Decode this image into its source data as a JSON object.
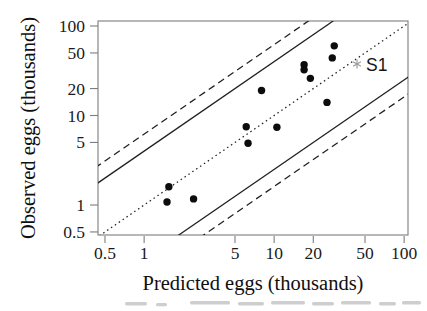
{
  "chart_data": {
    "type": "scatter",
    "title": "",
    "xlabel": "Predicted eggs (thousands)",
    "ylabel": "Observed eggs (thousands)",
    "xscale": "log",
    "yscale": "log",
    "xlim": [
      0.44,
      108
    ],
    "ylim": [
      0.44,
      114
    ],
    "xticks": [
      0.5,
      1,
      5,
      10,
      20,
      50,
      100
    ],
    "xtick_labels": [
      "0.5",
      "1",
      "5",
      "10",
      "20",
      "50",
      "100"
    ],
    "yticks": [
      100,
      50,
      20,
      10,
      5,
      1,
      0.5
    ],
    "ytick_labels": [
      "100",
      "50",
      "20",
      "10",
      "5",
      "1",
      "0.5"
    ],
    "grid": false,
    "legend": "none",
    "points": [
      [
        29,
        60
      ],
      [
        28,
        44
      ],
      [
        17,
        37
      ],
      [
        17,
        32.5
      ],
      [
        19,
        26
      ],
      [
        8,
        19
      ],
      [
        25.5,
        14
      ],
      [
        6.1,
        7.5
      ],
      [
        10.5,
        7.4
      ],
      [
        6.3,
        4.9
      ],
      [
        1.55,
        1.6
      ],
      [
        2.4,
        1.17
      ],
      [
        1.5,
        1.08
      ]
    ],
    "special_point": {
      "label": "S1",
      "x": 45,
      "y": 38,
      "marker": "asterisk",
      "marker_color": "#9a9a9a"
    },
    "reference_lines": [
      {
        "name": "upper-dashed-band",
        "style": "dashed",
        "slope": 1,
        "factor": 6.2
      },
      {
        "name": "upper-solid-band",
        "style": "solid",
        "slope": 1,
        "factor": 4.0
      },
      {
        "name": "identity-line",
        "style": "dotted",
        "slope": 1,
        "factor": 1.0
      },
      {
        "name": "lower-solid-band",
        "style": "solid",
        "slope": 1,
        "factor": 0.25
      },
      {
        "name": "lower-dashed-band",
        "style": "dashed",
        "slope": 1,
        "factor": 0.161
      }
    ],
    "point_color": "#0c0c0c",
    "line_color": "#1f1f1f",
    "frame_color": "#7d7d7d"
  }
}
